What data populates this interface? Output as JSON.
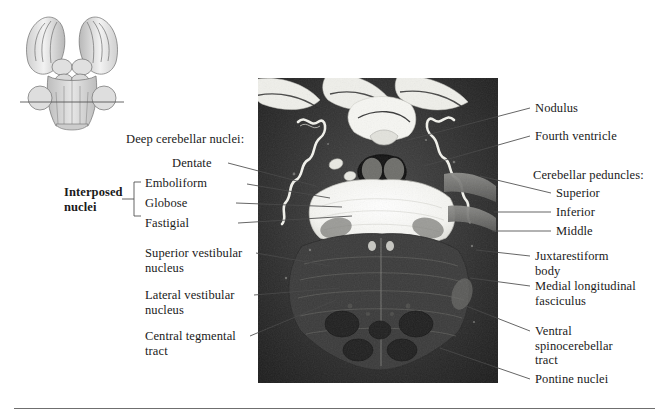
{
  "figure": {
    "background_color": "#ffffff",
    "leader_color": "#4a4a4a"
  },
  "inset": {
    "name": "brainstem-orientation-inset",
    "description": "Dorsal view of the brainstem and cerebellum with a horizontal section level line"
  },
  "photo": {
    "name": "axial-myelin-stained-section",
    "description": "Myelin-stained axial section through the pons showing deep cerebellar nuclei, fourth ventricle, cerebellar peduncles and pontine nuclei"
  },
  "labels_left": {
    "group_heading": "Deep cerebellar nuclei:",
    "dentate": "Dentate",
    "emboliform": "Emboliform",
    "globose": "Globose",
    "fastigial": "Fastigial",
    "interposed": "Interposed\nnuclei",
    "superior_vestibular": "Superior vestibular\nnucleus",
    "lateral_vestibular": "Lateral vestibular\nnucleus",
    "central_tegmental": "Central tegmental\ntract"
  },
  "labels_right": {
    "nodulus": "Nodulus",
    "fourth_ventricle": "Fourth ventricle",
    "peduncles_heading": "Cerebellar peduncles:",
    "superior": "Superior",
    "inferior": "Inferior",
    "middle": "Middle",
    "juxtarestiform": "Juxtarestiform\nbody",
    "mlf": "Medial longitudinal\nfasciculus",
    "ventral_spinocerebellar": "Ventral\nspinocerebellar\ntract",
    "pontine_nuclei": "Pontine nuclei"
  }
}
